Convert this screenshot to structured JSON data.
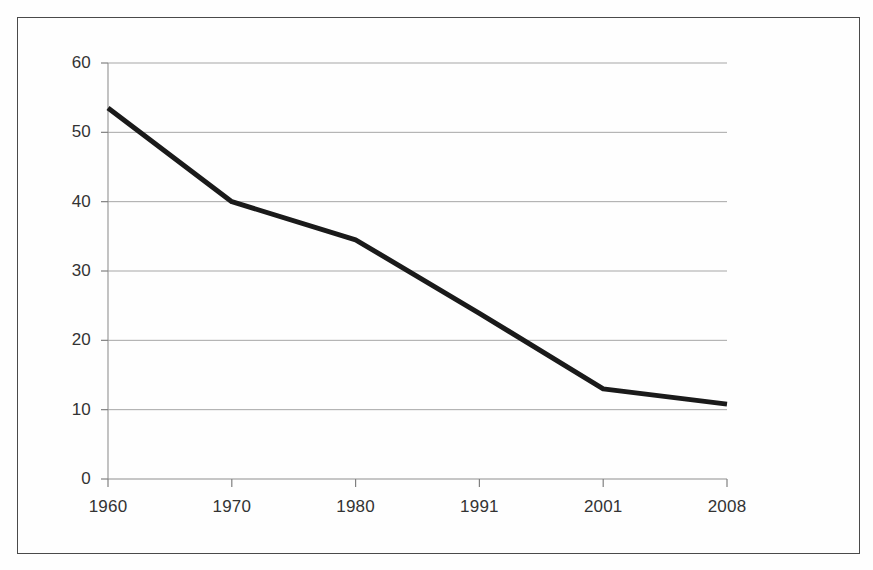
{
  "chart_data": {
    "type": "line",
    "title": "",
    "subtitle": "",
    "xlabel": "",
    "ylabel": "",
    "categories": [
      "1960",
      "1970",
      "1980",
      "1991",
      "2001",
      "2008"
    ],
    "x_tick_labels": [
      "1960",
      "1970",
      "1980",
      "1991",
      "2001",
      "2008"
    ],
    "y_tick_labels": [
      "0",
      "10",
      "20",
      "30",
      "40",
      "50",
      "60"
    ],
    "y_ticks": [
      0,
      10,
      20,
      30,
      40,
      50,
      60
    ],
    "ylim": [
      0,
      60
    ],
    "grid": "horizontal",
    "legend": "none",
    "annotations": [],
    "series": [
      {
        "name": "series-1",
        "color": "#1a1a1a",
        "line_width": 5,
        "markers": "none",
        "values": [
          53.5,
          40.0,
          34.5,
          23.9,
          13.0,
          10.8
        ]
      }
    ]
  },
  "axes": {
    "y_axis_name": "value-axis",
    "x_axis_name": "category-axis",
    "gridline_color": "#a6a6a6",
    "axis_line_color": "#808080",
    "frame_color": "#4a4a4a"
  }
}
